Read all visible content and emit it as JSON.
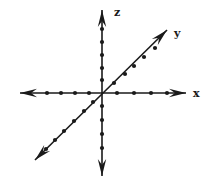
{
  "diagram": {
    "background": "#ffffff",
    "stroke_color": "#1a1a1a",
    "origin": {
      "x": 102,
      "y": 93
    },
    "axes": [
      {
        "name": "x",
        "label": "x",
        "label_pos": {
          "x": 193,
          "y": 97
        },
        "start": {
          "x": 20,
          "y": 93
        },
        "end": {
          "x": 186,
          "y": 93
        },
        "arrow_both_ends": true,
        "ticks": [
          {
            "x": 47,
            "y": 93
          },
          {
            "x": 61,
            "y": 93
          },
          {
            "x": 75,
            "y": 93
          },
          {
            "x": 89,
            "y": 93
          },
          {
            "x": 117,
            "y": 93
          },
          {
            "x": 134,
            "y": 93
          },
          {
            "x": 151,
            "y": 93
          },
          {
            "x": 167,
            "y": 93
          }
        ]
      },
      {
        "name": "y",
        "label": "y",
        "label_pos": {
          "x": 174,
          "y": 37
        },
        "start": {
          "x": 35,
          "y": 160
        },
        "end": {
          "x": 167,
          "y": 30
        },
        "arrow_both_ends": true,
        "ticks": [
          {
            "x": 46,
            "y": 149
          },
          {
            "x": 55,
            "y": 140
          },
          {
            "x": 64,
            "y": 131
          },
          {
            "x": 74,
            "y": 121
          },
          {
            "x": 84,
            "y": 111
          },
          {
            "x": 93,
            "y": 102
          },
          {
            "x": 114,
            "y": 83
          },
          {
            "x": 125,
            "y": 74
          },
          {
            "x": 134,
            "y": 66
          },
          {
            "x": 144,
            "y": 57
          },
          {
            "x": 155,
            "y": 48
          }
        ]
      },
      {
        "name": "z",
        "label": "z",
        "label_pos": {
          "x": 114,
          "y": 16
        },
        "start": {
          "x": 102,
          "y": 176
        },
        "end": {
          "x": 102,
          "y": 10
        },
        "arrow_both_ends": true,
        "ticks": [
          {
            "x": 102,
            "y": 29
          },
          {
            "x": 102,
            "y": 42
          },
          {
            "x": 102,
            "y": 55
          },
          {
            "x": 102,
            "y": 68
          },
          {
            "x": 102,
            "y": 80
          },
          {
            "x": 102,
            "y": 106
          },
          {
            "x": 102,
            "y": 120
          },
          {
            "x": 102,
            "y": 134
          },
          {
            "x": 102,
            "y": 148
          }
        ]
      }
    ]
  }
}
